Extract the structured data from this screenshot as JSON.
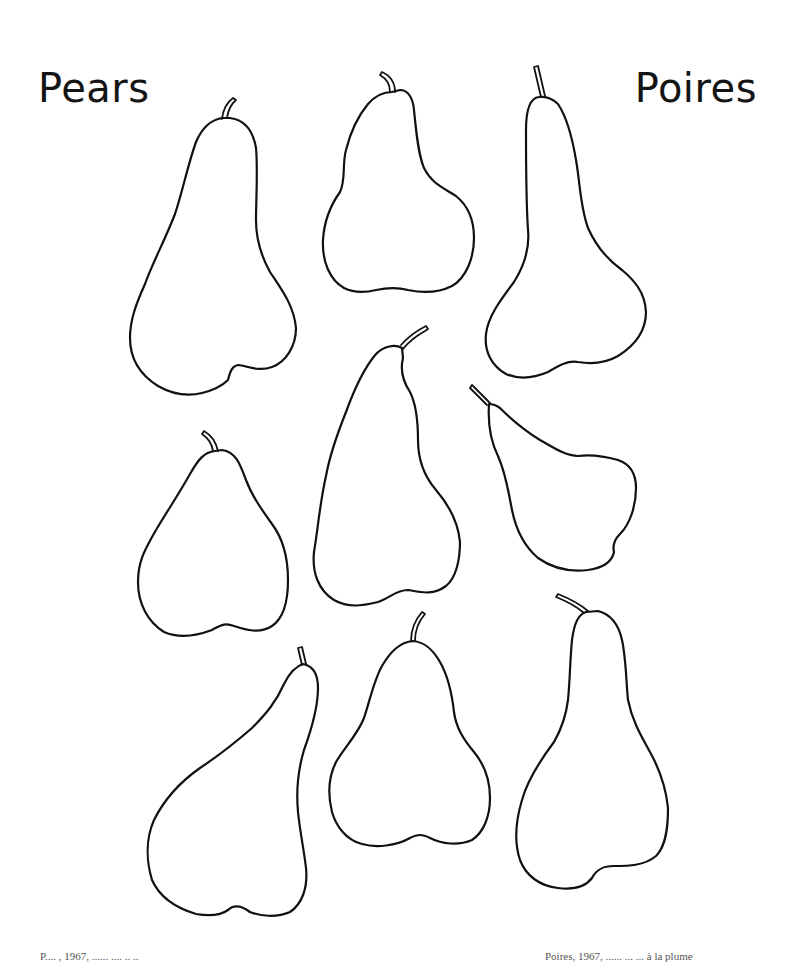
{
  "page": {
    "title_en": "Pears",
    "title_fr": "Poires"
  },
  "artwork": {
    "subject": "pear outlines",
    "count": 9,
    "pears": [
      {
        "id": 1,
        "row": 1,
        "col": 1
      },
      {
        "id": 2,
        "row": 1,
        "col": 2
      },
      {
        "id": 3,
        "row": 1,
        "col": 3
      },
      {
        "id": 4,
        "row": 2,
        "col": 1
      },
      {
        "id": 5,
        "row": 2,
        "col": 2
      },
      {
        "id": 6,
        "row": 2,
        "col": 3
      },
      {
        "id": 7,
        "row": 3,
        "col": 1
      },
      {
        "id": 8,
        "row": 3,
        "col": 2
      },
      {
        "id": 9,
        "row": 3,
        "col": 3
      }
    ],
    "stroke_color": "#111111",
    "background_color": "#ffffff"
  },
  "footer": {
    "left_caption": "P.... , 1967, ...... ....   ..  ..",
    "right_caption": "Poires, 1967, ...... ... ... à la plume"
  }
}
